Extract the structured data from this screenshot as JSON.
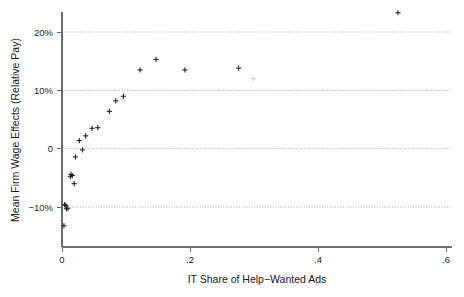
{
  "chart_data": {
    "type": "scatter",
    "title": "",
    "xlabel": "IT Share of Help−Wanted Ads",
    "ylabel": "Mean Firm Wage Effects (Relative Pay)",
    "xlim": [
      0,
      0.6
    ],
    "ylim": [
      -0.14,
      0.25
    ],
    "xticks": [
      0,
      0.2,
      0.4,
      0.6
    ],
    "xtick_labels": [
      "0",
      ".2",
      ".4",
      ".6"
    ],
    "yticks": [
      -0.1,
      0,
      0.1,
      0.2
    ],
    "ytick_labels": [
      "−10%",
      "0",
      "10%",
      "20%"
    ],
    "grid": "horizontal-dotted",
    "legend": "none",
    "marker": "plus",
    "marker_color": "#1f1f1f",
    "points": [
      {
        "x": 0.003,
        "y": -0.132
      },
      {
        "x": 0.004,
        "y": -0.096
      },
      {
        "x": 0.006,
        "y": -0.097
      },
      {
        "x": 0.007,
        "y": -0.103
      },
      {
        "x": 0.009,
        "y": -0.102
      },
      {
        "x": 0.013,
        "y": -0.048
      },
      {
        "x": 0.016,
        "y": -0.046
      },
      {
        "x": 0.019,
        "y": -0.06
      },
      {
        "x": 0.014,
        "y": -0.044
      },
      {
        "x": 0.021,
        "y": -0.014
      },
      {
        "x": 0.027,
        "y": 0.014
      },
      {
        "x": 0.032,
        "y": -0.002
      },
      {
        "x": 0.037,
        "y": 0.022
      },
      {
        "x": 0.047,
        "y": 0.035
      },
      {
        "x": 0.056,
        "y": 0.036
      },
      {
        "x": 0.074,
        "y": 0.064
      },
      {
        "x": 0.084,
        "y": 0.082
      },
      {
        "x": 0.096,
        "y": 0.09
      },
      {
        "x": 0.122,
        "y": 0.135
      },
      {
        "x": 0.147,
        "y": 0.153
      },
      {
        "x": 0.192,
        "y": 0.135
      },
      {
        "x": 0.276,
        "y": 0.138
      },
      {
        "x": 0.299,
        "y": 0.12,
        "faint": true
      },
      {
        "x": 0.525,
        "y": 0.233
      }
    ]
  },
  "axes": {
    "y_label": "Mean Firm Wage Effects (Relative Pay)",
    "x_label": "IT Share of Help−Wanted Ads",
    "y_tick_0": "20%",
    "y_tick_1": "10%",
    "y_tick_2": "0",
    "y_tick_3": "−10%",
    "x_tick_0": "0",
    "x_tick_1": ".2",
    "x_tick_2": ".4",
    "x_tick_3": ".6"
  }
}
